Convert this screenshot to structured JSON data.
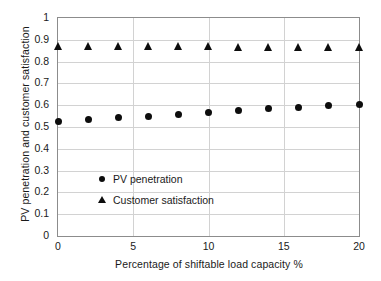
{
  "chart_data": {
    "type": "scatter",
    "title": "",
    "xlabel": "Percentage of shiftable load capacity %",
    "ylabel": "PV penetration and customer satisfaction",
    "x": [
      0,
      2,
      4,
      6,
      8,
      10,
      12,
      14,
      16,
      18,
      20
    ],
    "xlim": [
      0,
      20
    ],
    "ylim": [
      0,
      1
    ],
    "xticks": [
      "0",
      "5",
      "10",
      "15",
      "20"
    ],
    "xtick_values": [
      0,
      5,
      10,
      15,
      20
    ],
    "yticks": [
      "0",
      "0.1",
      "0.2",
      "0.3",
      "0.4",
      "0.5",
      "0.6",
      "0.7",
      "0.8",
      "0.9",
      "1"
    ],
    "ytick_values": [
      0,
      0.1,
      0.2,
      0.3,
      0.4,
      0.5,
      0.6,
      0.7,
      0.8,
      0.9,
      1
    ],
    "grid": "horizontal-and-vertical",
    "legend_position": "inside-center",
    "series": [
      {
        "name": "PV penetration",
        "marker": "circle",
        "color": "#0d0d0d",
        "values": [
          0.525,
          0.533,
          0.542,
          0.55,
          0.558,
          0.567,
          0.575,
          0.583,
          0.591,
          0.597,
          0.604
        ]
      },
      {
        "name": "Customer satisfaction",
        "marker": "triangle",
        "color": "#0d0d0d",
        "values": [
          0.873,
          0.873,
          0.872,
          0.871,
          0.87,
          0.87,
          0.869,
          0.868,
          0.867,
          0.866,
          0.865
        ]
      }
    ]
  },
  "axes": {
    "y_title": "PV penetration and customer satisfaction",
    "x_title": "Percentage of shiftable load capacity %"
  },
  "legend": {
    "items": [
      {
        "label": "PV penetration",
        "marker": "circle"
      },
      {
        "label": "Customer satisfaction",
        "marker": "triangle"
      }
    ]
  },
  "colors": {
    "marker": "#0d0d0d",
    "gridline": "#d2d2d2",
    "frame": "#8c8c8c",
    "text": "#1a1a1a",
    "background": "#ffffff"
  }
}
